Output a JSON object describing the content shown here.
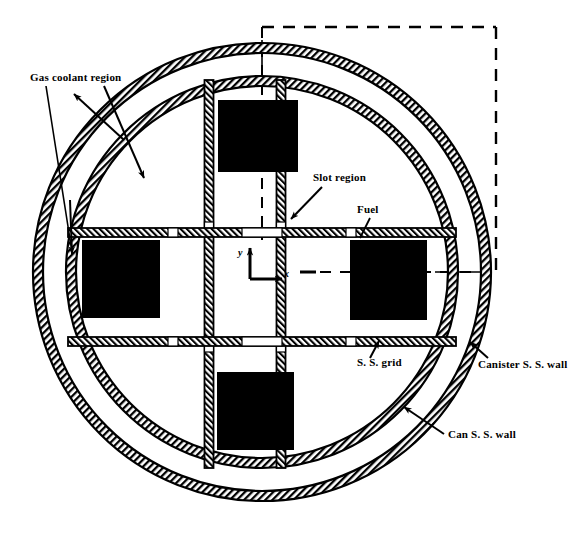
{
  "figure": {
    "type": "technical-cross-section-diagram",
    "background_color": "#ffffff",
    "line_color": "#000000",
    "fill_color_fuel": "#000000"
  },
  "labels": {
    "gas_coolant_region": "Gas coolant region",
    "slot_region": "Slot region",
    "fuel": "Fuel",
    "ss_grid": "S. S. grid",
    "canister_ss_wall": "Canister S. S. wall",
    "can_ss_wall": "Can S. S. wall"
  },
  "axes": {
    "y_label": "y",
    "x_label": "x",
    "origin_x": 250,
    "origin_y": 279
  },
  "geometry": {
    "outer_circle": {
      "cx": 262,
      "cy": 272,
      "r_outer": 229,
      "r_inner": 219
    },
    "inner_circle": {
      "cx": 262,
      "cy": 272,
      "r_outer": 196,
      "r_inner": 186
    },
    "grid": {
      "vertical_bars_x": [
        209,
        281
      ],
      "horizontal_bars_y": [
        232,
        342
      ],
      "bar_thickness": 9
    },
    "fuel_squares": [
      {
        "name": "top",
        "x": 218,
        "y": 100,
        "w": 80,
        "h": 72
      },
      {
        "name": "bottom",
        "x": 217,
        "y": 372,
        "w": 77,
        "h": 78
      },
      {
        "name": "left",
        "x": 82,
        "y": 240,
        "w": 78,
        "h": 78
      },
      {
        "name": "right",
        "x": 350,
        "y": 240,
        "w": 77,
        "h": 80
      }
    ],
    "dashed_corner_box": {
      "x1": 262,
      "y1": 27,
      "x2": 496,
      "y2": 273
    }
  }
}
